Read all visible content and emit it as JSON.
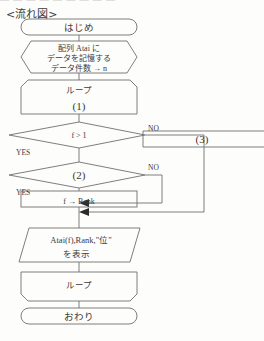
{
  "page": {
    "top_clipped_text": "— — — — — — — — —",
    "title": "<流れ図>"
  },
  "flowchart": {
    "nodes": {
      "start": {
        "shape": "terminator",
        "label": "はじめ"
      },
      "prepare": {
        "shape": "preparation",
        "line1": "配列 Atai に",
        "line2": "データを記憶する",
        "line3": "データ件数 → n"
      },
      "loop_start": {
        "shape": "loop-start",
        "label": "ループ",
        "sublabel": "(1)"
      },
      "decision1": {
        "shape": "decision",
        "label": "f > 1",
        "yes": "YES",
        "no": "NO"
      },
      "box3": {
        "shape": "process",
        "label": "(3)"
      },
      "decision2": {
        "shape": "decision",
        "label": "(2)",
        "yes": "YES",
        "no": "NO"
      },
      "assign": {
        "shape": "process",
        "label": "f → Rank"
      },
      "output": {
        "shape": "output",
        "line1": "Atai(f),Rank,\"位\"",
        "line2": "を表示"
      },
      "loop_end": {
        "shape": "loop-end",
        "label": "ループ"
      },
      "end": {
        "shape": "terminator",
        "label": "おわり"
      }
    },
    "colors": {
      "stroke": "#6f6f6f",
      "text": "#3a3a3a",
      "background": "#fdfdfc"
    }
  }
}
